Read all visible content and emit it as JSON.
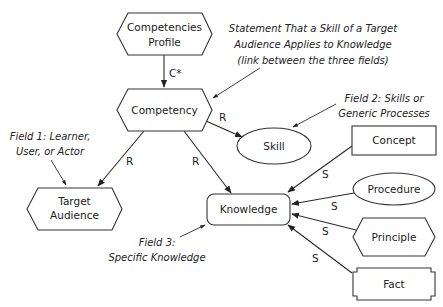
{
  "nodes": {
    "competencies_profile": {
      "line1": "Competencies",
      "line2": "Profile",
      "shape": "hexagon"
    },
    "competency": {
      "label": "Competency",
      "shape": "hexagon"
    },
    "skill": {
      "label": "Skill",
      "shape": "ellipse"
    },
    "target_audience": {
      "line1": "Target",
      "line2": "Audience",
      "shape": "hexagon"
    },
    "knowledge": {
      "label": "Knowledge",
      "shape": "rounded-rectangle"
    },
    "concept": {
      "label": "Concept",
      "shape": "rectangle"
    },
    "procedure": {
      "label": "Procedure",
      "shape": "ellipse"
    },
    "principle": {
      "label": "Principle",
      "shape": "hexagon"
    },
    "fact": {
      "label": "Fact",
      "shape": "notched-rectangle"
    }
  },
  "edges": {
    "profile_to_competency": {
      "label": "C*",
      "from": "Competencies Profile",
      "to": "Competency"
    },
    "competency_to_skill": {
      "label": "R",
      "from": "Competency",
      "to": "Skill"
    },
    "competency_to_audience": {
      "label": "R",
      "from": "Competency",
      "to": "Target Audience"
    },
    "competency_to_knowledge": {
      "label": "R",
      "from": "Competency",
      "to": "Knowledge"
    },
    "concept_to_knowledge": {
      "label": "S",
      "from": "Concept",
      "to": "Knowledge"
    },
    "procedure_to_knowledge": {
      "label": "S",
      "from": "Procedure",
      "to": "Knowledge"
    },
    "principle_to_knowledge": {
      "label": "S",
      "from": "Principle",
      "to": "Knowledge"
    },
    "fact_to_knowledge": {
      "label": "S",
      "from": "Fact",
      "to": "Knowledge"
    }
  },
  "annotations": {
    "statement": {
      "line1": "Statement That a Skill of a Target",
      "line2": "Audience Applies to Knowledge",
      "line3": "(link between the three fields)"
    },
    "field1": {
      "line1": "Field 1: Learner,",
      "line2": "User, or Actor"
    },
    "field2": {
      "line1": "Field 2: Skills or",
      "line2": "Generic Processes"
    },
    "field3": {
      "line1": "Field 3:",
      "line2": "Specific Knowledge"
    }
  }
}
